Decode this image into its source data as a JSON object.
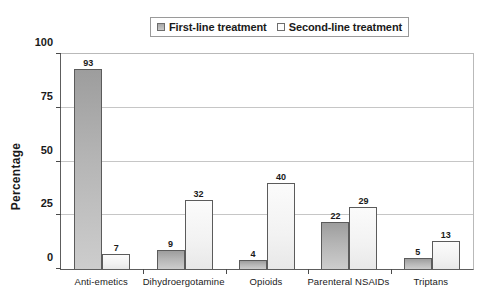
{
  "legend": {
    "entries": [
      {
        "label": "First-line treatment",
        "swatch": "filled-gray-square-icon"
      },
      {
        "label": "Second-line treatment",
        "swatch": "empty-white-square-icon"
      }
    ]
  },
  "axes": {
    "y_title": "Percentage",
    "y_ticks": [
      "0",
      "25",
      "50",
      "75",
      "100"
    ]
  },
  "chart_data": {
    "type": "bar",
    "title": "",
    "subtitle": "",
    "xlabel": "",
    "ylabel": "Percentage",
    "ylim": [
      0,
      100
    ],
    "yticks": [
      0,
      25,
      50,
      75,
      100
    ],
    "grid": true,
    "legend_position": "top",
    "categories": [
      "Anti-emetics",
      "Dihydroergotamine",
      "Opioids",
      "Parenteral NSAIDs",
      "Triptans"
    ],
    "series": [
      {
        "name": "First-line treatment",
        "values": [
          93,
          9,
          4,
          22,
          5
        ]
      },
      {
        "name": "Second-line treatment",
        "values": [
          7,
          32,
          40,
          29,
          13
        ]
      }
    ],
    "colors": {
      "first_line": "#b5b5b5",
      "second_line": "#f4f4f4",
      "bar_border": "#5b5b5b",
      "gridline": "#c6c6c6",
      "axis": "#5d5d5d",
      "text": "#1a1a1a",
      "background": "#ffffff"
    }
  }
}
